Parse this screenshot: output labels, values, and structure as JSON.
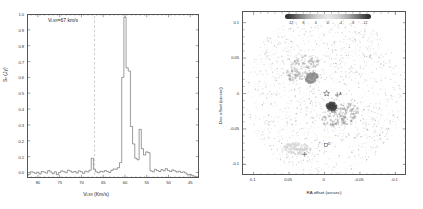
{
  "figure": {
    "panel_count": 2
  },
  "chart_data": [
    {
      "id": "maser-spectrum",
      "type": "line",
      "title": "",
      "annotation": "Vₛₛᵣ=67 km/s",
      "annotation_parts": {
        "prefix": "V",
        "subscript": "LSR",
        "suffix": "=67 km/s"
      },
      "xlabel": "Vₗₛᵣ (Km/s)",
      "xlabel_parts": {
        "prefix": "V",
        "subscript": "LSR",
        "suffix": " (Km/s)"
      },
      "ylabel": "Sᵥ (Jy)",
      "ylabel_parts": {
        "prefix": "S",
        "subscript": "ν",
        "suffix": " (Jy)"
      },
      "xlim": [
        82.5,
        43.0
      ],
      "ylim": [
        -0.035,
        1.0
      ],
      "x_inverted": true,
      "grid": false,
      "xticks": [
        80,
        75,
        70,
        65,
        60,
        55,
        50,
        45
      ],
      "xticklabels": [
        "80",
        "75",
        "70",
        "65",
        "60",
        "55",
        "50",
        "45"
      ],
      "yticks": [
        0.0,
        0.1,
        0.2,
        0.3,
        0.4,
        0.5,
        0.6,
        0.7,
        0.8,
        0.9,
        1.0
      ],
      "yticklabels": [
        "0.0",
        "0.1",
        "0.2",
        "0.3",
        "0.4",
        "0.5",
        "0.6",
        "0.7",
        "0.8",
        "0.9",
        "1.0"
      ],
      "vline": {
        "x": 67,
        "style": "dashed",
        "color": "#9a9a9a",
        "label": "V_LSR=67 km/s"
      },
      "line_color": "#4a4a4a",
      "x": [
        82.5,
        82.0,
        81.5,
        81.0,
        80.5,
        80.0,
        79.5,
        79.0,
        78.5,
        78.0,
        77.5,
        77.0,
        76.5,
        76.0,
        75.5,
        75.0,
        74.5,
        74.0,
        73.5,
        73.0,
        72.5,
        72.0,
        71.5,
        71.0,
        70.5,
        70.0,
        69.5,
        69.0,
        68.5,
        68.0,
        67.5,
        67.0,
        66.5,
        66.0,
        65.5,
        65.0,
        64.5,
        64.0,
        63.5,
        63.0,
        62.5,
        62.0,
        61.5,
        61.0,
        60.5,
        60.0,
        59.5,
        59.0,
        58.5,
        58.0,
        57.5,
        57.0,
        56.5,
        56.0,
        55.5,
        55.0,
        54.5,
        54.0,
        53.5,
        53.0,
        52.5,
        52.0,
        51.5,
        51.0,
        50.5,
        50.0,
        49.5,
        49.0,
        48.5,
        48.0,
        47.5,
        47.0,
        46.5,
        46.0,
        45.5,
        45.0,
        44.5,
        44.0,
        43.5,
        43.0
      ],
      "y": [
        -0.022,
        -0.012,
        0.004,
        0.001,
        -0.006,
        0.002,
        -0.01,
        0.006,
        0.002,
        -0.004,
        0.012,
        0.003,
        -0.008,
        0.004,
        -0.014,
        0.0,
        0.01,
        0.005,
        -0.002,
        0.014,
        0.009,
        0.001,
        0.006,
        -0.004,
        0.01,
        0.004,
        -0.006,
        0.008,
        0.003,
        0.014,
        0.09,
        0.02,
        0.004,
        -0.002,
        0.008,
        0.003,
        0.012,
        0.006,
        0.0,
        0.014,
        0.022,
        0.02,
        0.03,
        0.062,
        0.6,
        0.98,
        0.66,
        0.64,
        0.29,
        0.18,
        0.09,
        0.08,
        0.272,
        0.15,
        0.11,
        0.13,
        0.125,
        0.01,
        0.004,
        0.02,
        0.012,
        0.006,
        0.018,
        0.01,
        0.024,
        0.012,
        0.006,
        0.016,
        0.01,
        0.002,
        0.008,
        0.0,
        0.004,
        -0.004,
        -0.016,
        -0.012,
        -0.018,
        -0.024,
        -0.028,
        -0.03
      ]
    },
    {
      "id": "position-velocity-map",
      "type": "scatter",
      "title": "",
      "xlabel": "RA offset (arcsec)",
      "ylabel": "Dec offset (arcsec)",
      "xlim": [
        0.115,
        -0.115
      ],
      "ylim": [
        -0.115,
        0.115
      ],
      "x_inverted": true,
      "grid": false,
      "xticks": [
        0.1,
        0.05,
        0,
        -0.05,
        -0.1
      ],
      "xticklabels": [
        "0.1",
        "0.05",
        "0",
        "-0.05",
        "-0.1"
      ],
      "yticks": [
        0.1,
        0.05,
        0,
        -0.05,
        -0.1
      ],
      "yticklabels": [
        "0.1",
        "0.05",
        "0",
        "-0.05",
        "-0.1"
      ],
      "colorbar": {
        "label": "",
        "ticks": [
          12,
          8,
          4,
          0,
          -4,
          -8,
          -12
        ],
        "ticklabels": [
          "12",
          "8",
          "4",
          "0",
          "-4",
          "-8",
          "-12"
        ],
        "vmin": -14,
        "vmax": 14,
        "cmap": "diverging-grayscale",
        "orientation": "horizontal",
        "position": "top-inside"
      },
      "markers": [
        {
          "name": "central-star",
          "symbol": "star",
          "x": -0.003,
          "y": 0.0,
          "label": ""
        },
        {
          "name": "cross-marker-a",
          "symbol": "cross",
          "x": -0.018,
          "y": -0.002,
          "label": "A"
        },
        {
          "name": "cross-marker-b",
          "symbol": "cross",
          "x": -0.01,
          "y": -0.018,
          "label": "B"
        },
        {
          "name": "square-marker-c",
          "symbol": "square",
          "x": -0.012,
          "y": -0.024,
          "label": "C"
        },
        {
          "name": "square-marker-d",
          "symbol": "square",
          "x": -0.002,
          "y": -0.073,
          "label": "D"
        },
        {
          "name": "cross-marker-e",
          "symbol": "cross",
          "x": 0.028,
          "y": -0.086,
          "label": ""
        }
      ],
      "clusters": [
        {
          "name": "nw-lobe",
          "cx": 0.03,
          "cy": 0.035,
          "value": 5,
          "rx": 0.026,
          "ry": 0.016,
          "angle": -32
        },
        {
          "name": "se-lobe",
          "cx": -0.022,
          "cy": -0.03,
          "value": -6,
          "rx": 0.028,
          "ry": 0.016,
          "angle": -20
        },
        {
          "name": "core-blue",
          "cx": -0.01,
          "cy": -0.018,
          "value": -12,
          "rx": 0.007,
          "ry": 0.006,
          "angle": 0
        },
        {
          "name": "inner-nw",
          "cx": 0.018,
          "cy": 0.022,
          "value": 7,
          "rx": 0.009,
          "ry": 0.007,
          "angle": -30
        },
        {
          "name": "sw-faint",
          "cx": 0.038,
          "cy": -0.078,
          "value": 2,
          "rx": 0.02,
          "ry": 0.008,
          "angle": 5
        }
      ]
    }
  ]
}
